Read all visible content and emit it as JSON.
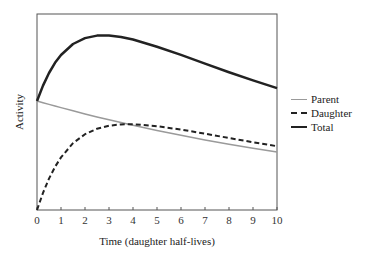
{
  "chart_data": {
    "type": "line",
    "title": "",
    "xlabel": "Time (daughter half-lives)",
    "ylabel": "Activity",
    "xlim": [
      0,
      10
    ],
    "ylim": [
      0,
      1.8
    ],
    "x_ticks": [
      "0",
      "1",
      "2",
      "3",
      "4",
      "5",
      "6",
      "7",
      "8",
      "9",
      "10"
    ],
    "y_ticks": [],
    "grid": false,
    "legend_position": "right",
    "x": [
      0,
      0.25,
      0.5,
      0.75,
      1,
      1.5,
      2,
      2.5,
      3,
      3.5,
      4,
      5,
      6,
      7,
      8,
      9,
      10
    ],
    "series": [
      {
        "name": "Parent",
        "style": "solid-gray",
        "values": [
          1.0,
          0.984,
          0.969,
          0.954,
          0.939,
          0.91,
          0.882,
          0.854,
          0.828,
          0.802,
          0.777,
          0.73,
          0.685,
          0.643,
          0.604,
          0.567,
          0.533
        ]
      },
      {
        "name": "Daughter",
        "style": "dashed-black",
        "values": [
          0.0,
          0.157,
          0.288,
          0.395,
          0.483,
          0.613,
          0.695,
          0.746,
          0.773,
          0.785,
          0.787,
          0.769,
          0.738,
          0.7,
          0.661,
          0.622,
          0.585
        ]
      },
      {
        "name": "Total",
        "style": "solid-black-thick",
        "values": [
          1.0,
          1.141,
          1.257,
          1.35,
          1.422,
          1.523,
          1.577,
          1.6,
          1.601,
          1.587,
          1.564,
          1.498,
          1.423,
          1.343,
          1.264,
          1.189,
          1.118
        ]
      }
    ],
    "colors": {
      "Parent": "#9a9a9a",
      "Daughter": "#222222",
      "Total": "#222222"
    }
  },
  "legend": {
    "items": [
      {
        "label": "Parent"
      },
      {
        "label": "Daughter"
      },
      {
        "label": "Total"
      }
    ]
  }
}
